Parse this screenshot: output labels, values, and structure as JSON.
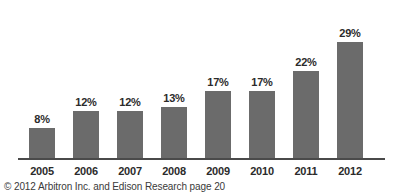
{
  "chart_data": {
    "type": "bar",
    "title": "",
    "subtitle": "",
    "xlabel": "",
    "ylabel": "",
    "categories": [
      "2005",
      "2006",
      "2007",
      "2008",
      "2009",
      "2010",
      "2011",
      "2012"
    ],
    "values": [
      8,
      12,
      12,
      13,
      17,
      17,
      22,
      29
    ],
    "value_labels": [
      "8%",
      "12%",
      "12%",
      "13%",
      "17%",
      "17%",
      "22%",
      "29%"
    ],
    "series": [
      {
        "name": "",
        "values": [
          8,
          12,
          12,
          13,
          17,
          17,
          22,
          29
        ]
      }
    ],
    "ylim": [
      0,
      34
    ],
    "grid": false,
    "legend": false,
    "legend_position": "none",
    "annotations": [],
    "colors": {
      "bar_fill": "#6b6b6b",
      "axis_line": "#4a4a4a",
      "label_text": "#2b2b2b",
      "footer_text": "#3a3a3a",
      "background": "#ffffff"
    }
  },
  "footer": {
    "credit": "© 2012 Arbitron Inc. and Edison Research page 20"
  }
}
